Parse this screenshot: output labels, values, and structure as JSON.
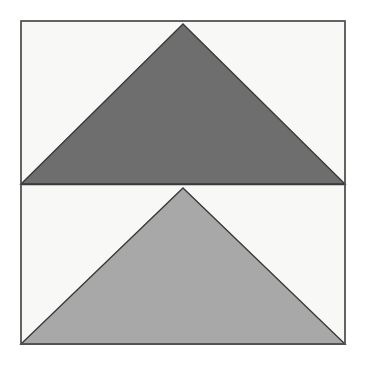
{
  "figure": {
    "canvas": {
      "width": 366,
      "height": 366,
      "page_background": "#ffffff"
    },
    "frame": {
      "name": "outer-square-frame",
      "x": 21,
      "y": 21,
      "width": 324,
      "height": 323,
      "fill": "#f8f8f7",
      "stroke": "#555555",
      "stroke_width": 1.4
    },
    "divider": {
      "name": "horizontal-divider",
      "x1": 21,
      "y1": 184.5,
      "x2": 345,
      "y2": 184.5,
      "stroke": "#3a3a3a",
      "stroke_width": 1.4,
      "description": "horizontal line splitting the frame into upper and lower halves"
    },
    "shapes": [
      {
        "name": "dark-triangle",
        "label": "Upper dark gray triangle",
        "orientation": "pointing-up",
        "fill": "#6e6e6e",
        "stroke": "#3a3a3a",
        "stroke_width": 1.4,
        "apex": {
          "x": 183,
          "y": 24
        },
        "base_left": {
          "x": 21,
          "y": 184
        },
        "base_right": {
          "x": 345,
          "y": 184
        },
        "points": "183,24 345,184 21,184",
        "base_width": 324,
        "height": 160
      },
      {
        "name": "light-triangle",
        "label": "Lower light gray triangle",
        "orientation": "pointing-up",
        "fill": "#a8a8a8",
        "stroke": "#3a3a3a",
        "stroke_width": 1.4,
        "apex": {
          "x": 183,
          "y": 188
        },
        "base_left": {
          "x": 21,
          "y": 344
        },
        "base_right": {
          "x": 345,
          "y": 344
        },
        "points": "183,188 345,344 21,344",
        "base_width": 324,
        "height": 156
      }
    ],
    "palette": {
      "page_background": "#ffffff",
      "panel_background": "#f8f8f7",
      "frame_stroke": "#555555",
      "shape_stroke": "#3a3a3a",
      "dark_gray": "#6e6e6e",
      "light_gray": "#a8a8a8"
    }
  }
}
